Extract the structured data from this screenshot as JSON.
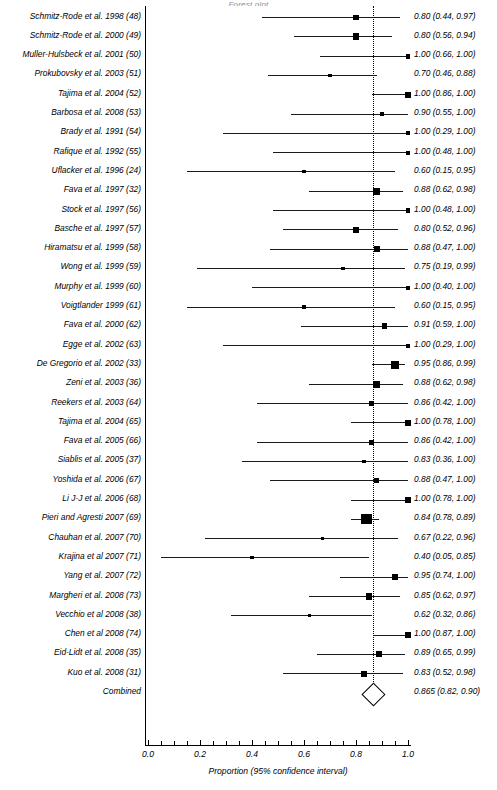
{
  "title": "Forest plot",
  "axis": {
    "xlabel": "Proportion (95% confidence interval)",
    "ticks": [
      "0.0",
      "0.2",
      "0.4",
      "0.6",
      "0.8",
      "1.0"
    ],
    "tick_values": [
      0.0,
      0.2,
      0.4,
      0.6,
      0.8,
      1.0
    ],
    "xmin": 0.0,
    "xmax": 1.0,
    "reference_line": 0.865
  },
  "chart_data": {
    "type": "forest",
    "title": "Forest plot",
    "xlabel": "Proportion (95% confidence interval)",
    "ylabel": "",
    "xlim": [
      0.0,
      1.0
    ],
    "grid": false,
    "legend": "none",
    "reference_line": 0.865,
    "columns": [
      "Study",
      "Proportion (95% CI)"
    ],
    "rows": [
      {
        "label": "Schmitz-Rode et al. 1998 (48)",
        "estimate": 0.8,
        "lower": 0.44,
        "upper": 0.97,
        "weight": 2.2,
        "ci_text": "0.80 (0.44, 0.97)"
      },
      {
        "label": "Schmitz-Rode et al. 2000 (49)",
        "estimate": 0.8,
        "lower": 0.56,
        "upper": 0.94,
        "weight": 3.2,
        "ci_text": "0.80 (0.56, 0.94)"
      },
      {
        "label": "Muller-Hulsbeck et al. 2001 (50)",
        "estimate": 1.0,
        "lower": 0.66,
        "upper": 1.0,
        "weight": 1.9,
        "ci_text": "1.00 (0.66, 1.00)"
      },
      {
        "label": "Prokubovsky et al. 2003 (51)",
        "estimate": 0.7,
        "lower": 0.46,
        "upper": 0.88,
        "weight": 0.9,
        "ci_text": "0.70 (0.46, 0.88)"
      },
      {
        "label": "Tajima et al. 2004 (52)",
        "estimate": 1.0,
        "lower": 0.86,
        "upper": 1.0,
        "weight": 2.8,
        "ci_text": "1.00 (0.86, 1.00)"
      },
      {
        "label": "Barbosa et al. 2008 (53)",
        "estimate": 0.9,
        "lower": 0.55,
        "upper": 1.0,
        "weight": 1.9,
        "ci_text": "0.90 (0.55, 1.00)"
      },
      {
        "label": "Brady et al. 1991 (54)",
        "estimate": 1.0,
        "lower": 0.29,
        "upper": 1.0,
        "weight": 1.4,
        "ci_text": "1.00 (0.29, 1.00)"
      },
      {
        "label": "Rafique et al. 1992 (55)",
        "estimate": 1.0,
        "lower": 0.48,
        "upper": 1.0,
        "weight": 1.2,
        "ci_text": "1.00 (0.48, 1.00)"
      },
      {
        "label": "Uflacker et al. 1996 (24)",
        "estimate": 0.6,
        "lower": 0.15,
        "upper": 0.95,
        "weight": 0.7,
        "ci_text": "0.60 (0.15, 0.95)"
      },
      {
        "label": "Fava et al. 1997 (32)",
        "estimate": 0.88,
        "lower": 0.62,
        "upper": 0.98,
        "weight": 3.0,
        "ci_text": "0.88 (0.62, 0.98)"
      },
      {
        "label": "Stock et al. 1997 (56)",
        "estimate": 1.0,
        "lower": 0.48,
        "upper": 1.0,
        "weight": 1.5,
        "ci_text": "1.00 (0.48, 1.00)"
      },
      {
        "label": "Basche et al. 1997 (57)",
        "estimate": 0.8,
        "lower": 0.52,
        "upper": 0.96,
        "weight": 2.6,
        "ci_text": "0.80 (0.52, 0.96)"
      },
      {
        "label": "Hiramatsu et al. 1999 (58)",
        "estimate": 0.88,
        "lower": 0.47,
        "upper": 1.0,
        "weight": 2.2,
        "ci_text": "0.88 (0.47, 1.00)"
      },
      {
        "label": "Wong et al. 1999 (59)",
        "estimate": 0.75,
        "lower": 0.19,
        "upper": 0.99,
        "weight": 0.7,
        "ci_text": "0.75 (0.19, 0.99)"
      },
      {
        "label": "Murphy et al. 1999 (60)",
        "estimate": 1.0,
        "lower": 0.4,
        "upper": 1.0,
        "weight": 1.4,
        "ci_text": "1.00 (0.40, 1.00)"
      },
      {
        "label": "Voigtlander 1999 (61)",
        "estimate": 0.6,
        "lower": 0.15,
        "upper": 0.95,
        "weight": 0.7,
        "ci_text": "0.60 (0.15, 0.95)"
      },
      {
        "label": "Fava et al. 2000 (62)",
        "estimate": 0.91,
        "lower": 0.59,
        "upper": 1.0,
        "weight": 2.4,
        "ci_text": "0.91 (0.59, 1.00)"
      },
      {
        "label": "Egge et al. 2002 (63)",
        "estimate": 1.0,
        "lower": 0.29,
        "upper": 1.0,
        "weight": 1.4,
        "ci_text": "1.00 (0.29, 1.00)"
      },
      {
        "label": "De Gregorio et al. 2002 (33)",
        "estimate": 0.95,
        "lower": 0.86,
        "upper": 0.99,
        "weight": 3.6,
        "ci_text": "0.95 (0.86, 0.99)"
      },
      {
        "label": "Zeni et al. 2003 (36)",
        "estimate": 0.88,
        "lower": 0.62,
        "upper": 0.98,
        "weight": 3.0,
        "ci_text": "0.88  (0.62, 0.98)"
      },
      {
        "label": "Reekers et al. 2003 (64)",
        "estimate": 0.86,
        "lower": 0.42,
        "upper": 1.0,
        "weight": 1.9,
        "ci_text": "0.86 (0.42, 1.00)"
      },
      {
        "label": "Tajima et al. 2004 (65)",
        "estimate": 1.0,
        "lower": 0.78,
        "upper": 1.0,
        "weight": 2.6,
        "ci_text": "1.00 (0.78, 1.00)"
      },
      {
        "label": "Fava et al. 2005 (66)",
        "estimate": 0.86,
        "lower": 0.42,
        "upper": 1.0,
        "weight": 1.9,
        "ci_text": "0.86 (0.42, 1.00)"
      },
      {
        "label": "Siablis et al. 2005 (37)",
        "estimate": 0.83,
        "lower": 0.36,
        "upper": 1.0,
        "weight": 1.0,
        "ci_text": "0.83 (0.36, 1.00)"
      },
      {
        "label": "Yoshida et al. 2006 (67)",
        "estimate": 0.88,
        "lower": 0.47,
        "upper": 1.0,
        "weight": 2.1,
        "ci_text": "0.88 (0.47, 1.00)"
      },
      {
        "label": "Li J-J et al. 2006 (68)",
        "estimate": 1.0,
        "lower": 0.78,
        "upper": 1.0,
        "weight": 2.6,
        "ci_text": "1.00 (0.78, 1.00)"
      },
      {
        "label": "Pieri and Agresti 2007 (69)",
        "estimate": 0.84,
        "lower": 0.78,
        "upper": 0.89,
        "weight": 5.4,
        "ci_text": "0.84 (0.78, 0.89)"
      },
      {
        "label": "Chauhan et al. 2007 (70)",
        "estimate": 0.67,
        "lower": 0.22,
        "upper": 0.96,
        "weight": 0.8,
        "ci_text": "0.67 (0.22, 0.96)"
      },
      {
        "label": "Krajina et al  2007 (71)",
        "estimate": 0.4,
        "lower": 0.05,
        "upper": 0.85,
        "weight": 0.7,
        "ci_text": "0.40 (0.05, 0.85)"
      },
      {
        "label": "Yang et al. 2007 (72)",
        "estimate": 0.95,
        "lower": 0.74,
        "upper": 1.0,
        "weight": 2.7,
        "ci_text": "0.95 (0.74, 1.00)"
      },
      {
        "label": "Margheri et al.  2008 (73)",
        "estimate": 0.85,
        "lower": 0.62,
        "upper": 0.97,
        "weight": 3.1,
        "ci_text": "0.85 (0.62, 0.97)"
      },
      {
        "label": "Vecchio et al 2008 (38)",
        "estimate": 0.62,
        "lower": 0.32,
        "upper": 0.86,
        "weight": 0.9,
        "ci_text": "0.62 (0.32, 0.86)"
      },
      {
        "label": "Chen et al 2008 (74)",
        "estimate": 1.0,
        "lower": 0.87,
        "upper": 1.0,
        "weight": 2.8,
        "ci_text": "1.00 (0.87, 1.00)"
      },
      {
        "label": "Eid-Lidt et al. 2008 (35)",
        "estimate": 0.89,
        "lower": 0.65,
        "upper": 0.99,
        "weight": 2.6,
        "ci_text": "0.89 (0.65, 0.99)"
      },
      {
        "label": "Kuo et al. 2008 (31)",
        "estimate": 0.83,
        "lower": 0.52,
        "upper": 0.98,
        "weight": 2.4,
        "ci_text": "0.83 (0.52, 0.98)"
      }
    ],
    "summary": {
      "label": "Combined",
      "estimate": 0.865,
      "lower": 0.82,
      "upper": 0.9,
      "ci_text": "0.865 (0.82, 0.90)"
    }
  }
}
